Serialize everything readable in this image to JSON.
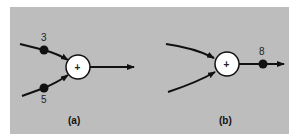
{
  "diagram": {
    "background_color": "#bdbdbd",
    "panels": [
      {
        "id": "a",
        "caption": "(a)",
        "summing_junction": {
          "symbol": "+",
          "cx": 78,
          "cy": 67,
          "r": 12
        },
        "inputs": [
          {
            "label": "3",
            "dot": {
              "x": 44,
              "y": 50
            }
          },
          {
            "label": "5",
            "dot": {
              "x": 44,
              "y": 88
            }
          }
        ],
        "output": {
          "arrow_to_x": 134
        }
      },
      {
        "id": "b",
        "caption": "(b)",
        "summing_junction": {
          "symbol": "+",
          "cx": 227,
          "cy": 64,
          "r": 12
        },
        "inputs": [
          {
            "label": ""
          },
          {
            "label": ""
          }
        ],
        "output": {
          "label": "8",
          "dot": {
            "x": 263,
            "y": 64
          },
          "arrow_to_x": 284
        }
      }
    ]
  }
}
